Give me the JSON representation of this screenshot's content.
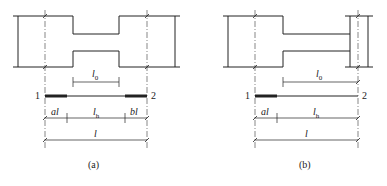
{
  "figure": {
    "panels": [
      {
        "id": "a",
        "caption": "(a)",
        "node_left": "1",
        "node_right": "2",
        "dim_clear_span": "l",
        "dim_clear_span_sub": "0",
        "dim_segment_left": "al",
        "dim_segment_mid": "l",
        "dim_segment_mid_sub": "h",
        "dim_segment_right": "bl",
        "dim_total": "l"
      },
      {
        "id": "b",
        "caption": "(b)",
        "node_left": "1",
        "node_right": "2",
        "dim_clear_span": "l",
        "dim_clear_span_sub": "0",
        "dim_segment_left": "al",
        "dim_segment_mid": "l",
        "dim_segment_mid_sub": "h",
        "dim_total": "l"
      }
    ],
    "colors": {
      "line": "#222222",
      "axis": "#555555",
      "background": "#ffffff"
    }
  }
}
